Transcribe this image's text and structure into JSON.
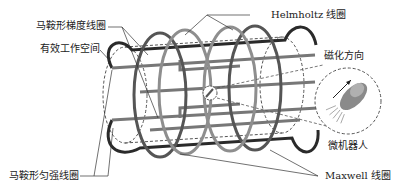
{
  "labels": {
    "saddle_gradient_coil": "马鞍形梯度线圈",
    "effective_workspace": "有效工作空间",
    "helmholtz_coil": "Helmholtz 线圈",
    "magnetization_direction": "磁化方向",
    "microrobot": "微机器人",
    "saddle_uniform_coil": "马鞍形匀强线圈",
    "maxwell_coil": "Maxwell 线圈"
  },
  "colors": {
    "dark_coil": "#2a2a2a",
    "mid_coil": "#6d6d6d",
    "light_coil": "#9a9a9a",
    "leader_line": "#333333"
  }
}
